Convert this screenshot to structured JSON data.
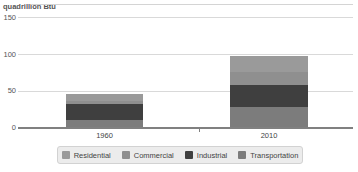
{
  "window": {
    "background": "#ffffff"
  },
  "chart_data": {
    "type": "bar",
    "stacked": true,
    "unit_label": "quadrillion Btu",
    "categories": [
      "1960",
      "2010"
    ],
    "series": [
      {
        "name": "Residential",
        "color": "#9a9a9a",
        "values": [
          9.0,
          21.9
        ]
      },
      {
        "name": "Commercial",
        "color": "#8f8f8f",
        "values": [
          4.6,
          18.2
        ]
      },
      {
        "name": "Industrial",
        "color": "#3f3f3f",
        "values": [
          20.8,
          30.1
        ]
      },
      {
        "name": "Transportation",
        "color": "#7c7c7c",
        "values": [
          10.6,
          27.7
        ]
      }
    ],
    "totals": [
      45.0,
      97.9
    ],
    "yticks": [
      0,
      50,
      100,
      150
    ],
    "ylim": [
      0,
      150
    ],
    "xlabel": "",
    "ylabel": "",
    "grid": true,
    "legend_position": "bottom",
    "stack_bottom_to_top": [
      "Transportation",
      "Industrial",
      "Commercial",
      "Residential"
    ],
    "colors": {
      "axis": "#808080",
      "gridline": "#d9d9d9",
      "legend_background": "#ececec",
      "legend_border": "#d2d2d2",
      "text": "#555555"
    }
  }
}
